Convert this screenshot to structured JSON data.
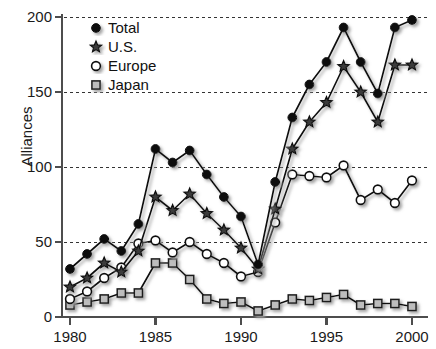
{
  "chart_data": {
    "type": "line",
    "title": "",
    "subtitle": "",
    "xlabel": "",
    "ylabel": "Alliances",
    "xlim": [
      1979.2,
      2000.8
    ],
    "ylim": [
      0,
      200
    ],
    "xticks": [
      1980,
      1985,
      1990,
      1995,
      2000
    ],
    "xtick_labels": [
      "1980",
      "1985",
      "1990",
      "1995",
      "2000"
    ],
    "yticks": [
      0,
      50,
      100,
      150,
      200
    ],
    "ytick_labels": [
      "0",
      "50",
      "100",
      "150",
      "200"
    ],
    "grid": "horizontal-dashed",
    "legend_position": "top-left-inside",
    "x": [
      1980,
      1981,
      1982,
      1983,
      1984,
      1985,
      1986,
      1987,
      1988,
      1989,
      1990,
      1991,
      1992,
      1993,
      1994,
      1995,
      1996,
      1997,
      1998,
      1999,
      2000
    ],
    "series": [
      {
        "name": "Total",
        "marker": "filled-circle",
        "color": "#111111",
        "values": [
          32,
          42,
          52,
          44,
          62,
          112,
          103,
          111,
          95,
          80,
          67,
          35,
          90,
          133,
          155,
          170,
          193,
          170,
          149,
          193,
          198
        ]
      },
      {
        "name": "U.S.",
        "marker": "star",
        "color": "#111111",
        "values": [
          20,
          26,
          36,
          30,
          44,
          80,
          71,
          82,
          69,
          58,
          46,
          32,
          72,
          112,
          130,
          143,
          167,
          150,
          130,
          168,
          168
        ]
      },
      {
        "name": "Europe",
        "marker": "open-circle",
        "color": "#ffffff",
        "values": [
          12,
          17,
          26,
          33,
          49,
          51,
          43,
          50,
          42,
          36,
          27,
          30,
          63,
          95,
          94,
          93,
          101,
          78,
          85,
          76,
          91
        ]
      },
      {
        "name": "Japan",
        "marker": "open-square",
        "color": "#b9b9b9",
        "values": [
          8,
          10,
          12,
          16,
          16,
          36,
          36,
          25,
          12,
          9,
          10,
          4,
          8,
          12,
          11,
          13,
          15,
          8,
          9,
          9,
          7
        ]
      }
    ]
  },
  "legend": {
    "items": [
      {
        "label": "Total",
        "marker": "filled-circle"
      },
      {
        "label": "U.S.",
        "marker": "star"
      },
      {
        "label": "Europe",
        "marker": "open-circle"
      },
      {
        "label": "Japan",
        "marker": "open-square"
      }
    ]
  },
  "style": {
    "axis_color": "#4d4d4d",
    "grid_color": "#333333",
    "line_color": "#111111",
    "shadow_color": "#b0b0b0"
  }
}
